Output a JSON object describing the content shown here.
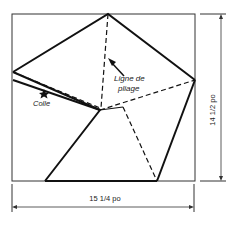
{
  "diagram": {
    "labels": {
      "fold_line_1": "Ligne de",
      "fold_line_2": "pliage",
      "glue": "Colle",
      "height_dim": "14 1/2 po",
      "width_dim": "15 1/4 po"
    },
    "colors": {
      "line": "#1a1a1a",
      "background": "#ffffff"
    }
  }
}
